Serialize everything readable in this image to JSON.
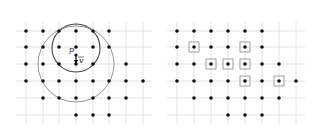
{
  "figure": {
    "left_panel": {
      "name": "neighborhood-radius-panel",
      "grid": {
        "cols_x": [
          26,
          43,
          59,
          76,
          93,
          109,
          126,
          143
        ],
        "rows_y": [
          31,
          47,
          64,
          81,
          98,
          115
        ],
        "line_color": "#dddddd",
        "x_extent": [
          16,
          152
        ],
        "y_extent": [
          22,
          124
        ]
      },
      "points": [
        [
          0,
          0
        ],
        [
          0,
          1
        ],
        [
          0,
          2
        ],
        [
          0,
          3
        ],
        [
          0,
          4
        ],
        [
          0,
          5
        ],
        [
          1,
          0
        ],
        [
          1,
          1
        ],
        [
          1,
          2
        ],
        [
          1,
          3
        ],
        [
          1,
          4
        ],
        [
          1,
          5
        ],
        [
          2,
          0
        ],
        [
          2,
          1
        ],
        [
          2,
          2
        ],
        [
          2,
          3
        ],
        [
          2,
          4
        ],
        [
          2,
          6
        ],
        [
          3,
          0
        ],
        [
          3,
          1
        ],
        [
          3,
          2
        ],
        [
          3,
          3
        ],
        [
          3,
          4
        ],
        [
          3,
          5
        ],
        [
          3,
          6
        ],
        [
          3,
          7
        ],
        [
          4,
          1
        ],
        [
          4,
          2
        ],
        [
          4,
          3
        ],
        [
          4,
          4
        ],
        [
          4,
          5
        ],
        [
          4,
          6
        ],
        [
          5,
          3
        ],
        [
          5,
          4
        ],
        [
          5,
          5
        ]
      ],
      "circles": [
        {
          "name": "small-circle",
          "cx": 76,
          "cy": 48,
          "r": 24,
          "color": "#444444",
          "width": 1.1
        },
        {
          "name": "large-circle",
          "cx": 76,
          "cy": 64,
          "r": 38,
          "color": "#888888",
          "width": 0.9
        }
      ],
      "point_p": {
        "label": "p",
        "x": 76,
        "y": 55
      },
      "vector_v": {
        "label": "v",
        "x1": 76,
        "y1": 55,
        "x2": 76,
        "y2": 64
      }
    },
    "right_panel": {
      "name": "selected-points-panel",
      "grid": {
        "cols_x": [
          177,
          194,
          211,
          228,
          245,
          262,
          279,
          296
        ],
        "rows_y": [
          31,
          47,
          64,
          81,
          98,
          115
        ],
        "line_color": "#dddddd",
        "x_extent": [
          167,
          305
        ],
        "y_extent": [
          22,
          124
        ]
      },
      "points": [
        [
          0,
          0
        ],
        [
          0,
          1
        ],
        [
          0,
          2
        ],
        [
          0,
          3
        ],
        [
          0,
          4
        ],
        [
          0,
          5
        ],
        [
          1,
          0
        ],
        [
          1,
          1
        ],
        [
          1,
          2
        ],
        [
          1,
          3
        ],
        [
          1,
          4
        ],
        [
          1,
          5
        ],
        [
          2,
          0
        ],
        [
          2,
          1
        ],
        [
          2,
          2
        ],
        [
          2,
          3
        ],
        [
          2,
          4
        ],
        [
          2,
          5
        ],
        [
          2,
          6
        ],
        [
          3,
          0
        ],
        [
          3,
          1
        ],
        [
          3,
          2
        ],
        [
          3,
          3
        ],
        [
          3,
          4
        ],
        [
          3,
          5
        ],
        [
          3,
          6
        ],
        [
          3,
          7
        ],
        [
          4,
          1
        ],
        [
          4,
          2
        ],
        [
          4,
          3
        ],
        [
          4,
          4
        ],
        [
          4,
          5
        ],
        [
          4,
          6
        ],
        [
          5,
          3
        ],
        [
          5,
          4
        ],
        [
          5,
          5
        ]
      ],
      "boxed_points": [
        [
          1,
          1
        ],
        [
          1,
          4
        ],
        [
          2,
          2
        ],
        [
          2,
          3
        ],
        [
          2,
          4
        ],
        [
          3,
          4
        ],
        [
          3,
          6
        ]
      ],
      "box_color": "#888888"
    },
    "dot_color": "#111111",
    "dot_radius": 1.8
  }
}
